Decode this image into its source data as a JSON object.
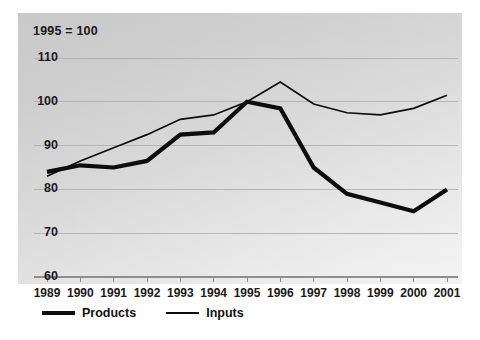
{
  "chart_data": {
    "type": "line",
    "title": "1995 = 100",
    "xlabel": "",
    "ylabel": "",
    "x": [
      1989,
      1990,
      1991,
      1992,
      1993,
      1994,
      1995,
      1996,
      1997,
      1998,
      1999,
      2000,
      2001
    ],
    "xtick_labels": [
      "1989",
      "1990",
      "1991",
      "1992",
      "1993",
      "1994",
      "1995",
      "1996",
      "1997",
      "1998",
      "1999",
      "2000",
      "2001"
    ],
    "ytick_labels": [
      "110",
      "100",
      "90",
      "80",
      "70",
      "60"
    ],
    "yticks": [
      110,
      100,
      90,
      80,
      70,
      60
    ],
    "ylim": [
      60,
      113
    ],
    "xlim": [
      1989,
      2001
    ],
    "grid": true,
    "grid_axis": "y",
    "legend_position": "below-plot-left",
    "series": [
      {
        "name": "Products",
        "style": "thick",
        "color": "#0d0d0d",
        "values": [
          84,
          85.5,
          85,
          86.5,
          92.5,
          93,
          100,
          98.5,
          85,
          79,
          77,
          75,
          80
        ]
      },
      {
        "name": "Inputs",
        "style": "thin",
        "color": "#0d0d0d",
        "values": [
          83,
          86.5,
          89.5,
          92.5,
          96,
          97,
          100,
          104.5,
          99.5,
          97.5,
          97,
          98.5,
          101.5
        ]
      }
    ]
  },
  "legend": {
    "products_label": "Products",
    "inputs_label": "Inputs"
  },
  "colors": {
    "line": "#0d0d0d",
    "grid": "#b0b0b0",
    "axis": "#8e8e8e",
    "text": "#1a1a1a"
  }
}
